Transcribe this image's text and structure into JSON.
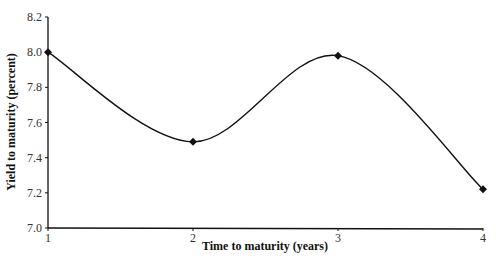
{
  "chart_data": {
    "type": "line",
    "title": "",
    "xlabel": "Time to maturity (years)",
    "ylabel": "Yield to maturity (percent)",
    "x": [
      1,
      2,
      3,
      4
    ],
    "series": [
      {
        "name": "Yield curve",
        "values": [
          8.0,
          7.49,
          7.98,
          7.22
        ],
        "marker": "diamond",
        "smooth": true,
        "color": "#111111"
      }
    ],
    "xticks": [
      "1",
      "2",
      "3",
      "4"
    ],
    "yticks": [
      "7.0",
      "7.2",
      "7.4",
      "7.6",
      "7.8",
      "8.0",
      "8.2"
    ],
    "xlim": [
      1,
      4
    ],
    "ylim": [
      7.0,
      8.2
    ],
    "grid": false,
    "legend": "none"
  }
}
